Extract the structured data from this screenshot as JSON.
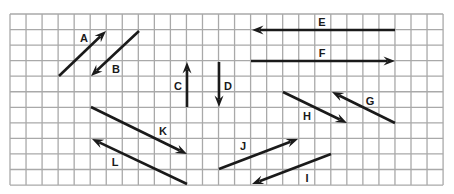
{
  "diagram": {
    "title": "",
    "colors": {
      "background": "#ffffff",
      "grid": "#a9a9a9",
      "arrow": "#1a1a1a",
      "label": "#1a1a1a"
    },
    "grid": {
      "x0": 10,
      "y0": 14,
      "cols": 27,
      "rows": 11,
      "cell_w": 16.04,
      "cell_h": 15.55
    },
    "vectors": [
      {
        "label": "A",
        "x1": 59,
        "y1": 76,
        "x2": 106,
        "y2": 31,
        "lx": 84,
        "ly": 42
      },
      {
        "label": "B",
        "x1": 139,
        "y1": 31,
        "x2": 91,
        "y2": 76,
        "lx": 116,
        "ly": 73
      },
      {
        "label": "C",
        "x1": 187,
        "y1": 107,
        "x2": 187,
        "y2": 62,
        "lx": 178,
        "ly": 90
      },
      {
        "label": "D",
        "x1": 219,
        "y1": 62,
        "x2": 219,
        "y2": 107,
        "lx": 228,
        "ly": 90
      },
      {
        "label": "E",
        "x1": 395,
        "y1": 30,
        "x2": 252,
        "y2": 30,
        "lx": 322,
        "ly": 26
      },
      {
        "label": "F",
        "x1": 251,
        "y1": 61,
        "x2": 395,
        "y2": 61,
        "lx": 322,
        "ly": 57
      },
      {
        "label": "G",
        "x1": 395,
        "y1": 123,
        "x2": 332,
        "y2": 92,
        "lx": 370,
        "ly": 105
      },
      {
        "label": "H",
        "x1": 283,
        "y1": 92,
        "x2": 347,
        "y2": 123,
        "lx": 307,
        "ly": 120
      },
      {
        "label": "I",
        "x1": 331,
        "y1": 154,
        "x2": 252,
        "y2": 184,
        "lx": 307,
        "ly": 182
      },
      {
        "label": "J",
        "x1": 219,
        "y1": 169,
        "x2": 298,
        "y2": 139,
        "lx": 243,
        "ly": 150
      },
      {
        "label": "K",
        "x1": 91,
        "y1": 107,
        "x2": 187,
        "y2": 154,
        "lx": 163,
        "ly": 135
      },
      {
        "label": "L",
        "x1": 187,
        "y1": 184,
        "x2": 92,
        "y2": 139,
        "lx": 115,
        "ly": 166
      }
    ]
  }
}
